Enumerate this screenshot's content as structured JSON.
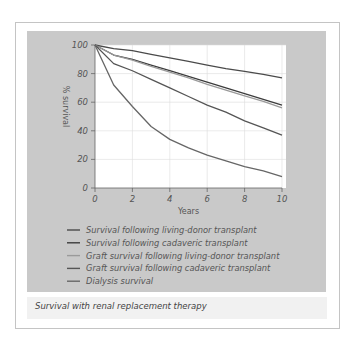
{
  "chart_data": {
    "type": "line",
    "title": "Survival with renal replacement therapy",
    "xlabel": "Years",
    "ylabel": "% survival",
    "x_ticks": [
      "0",
      "2",
      "4",
      "6",
      "8",
      "10"
    ],
    "y_ticks": [
      "0",
      "20",
      "40",
      "60",
      "80",
      "100"
    ],
    "xlim": [
      0,
      10
    ],
    "ylim": [
      0,
      100
    ],
    "grid": true,
    "legend_position": "bottom",
    "x": [
      0,
      1,
      2,
      3,
      4,
      5,
      6,
      7,
      8,
      9,
      10
    ],
    "series": [
      {
        "name": "Survival following living-donor transplant",
        "color": "#4a4a4a",
        "values": [
          100,
          97.5,
          96,
          93.5,
          91,
          88.5,
          86,
          83.5,
          81.5,
          79.5,
          77
        ]
      },
      {
        "name": "Survival following cadaveric transplant",
        "color": "#3c3c3c",
        "values": [
          100,
          93,
          90,
          86,
          82,
          78,
          74,
          70,
          66,
          62,
          58
        ]
      },
      {
        "name": "Graft survival following living-donor transplant",
        "color": "#9a9a9a",
        "values": [
          100,
          93,
          89.5,
          85,
          81,
          77,
          72.5,
          68.5,
          64.5,
          60.5,
          56
        ]
      },
      {
        "name": "Graft survival following cadaveric transplant",
        "color": "#555555",
        "values": [
          100,
          87,
          82,
          76,
          70,
          64,
          58,
          53,
          47,
          42,
          37
        ]
      },
      {
        "name": "Dialysis survival",
        "color": "#666666",
        "values": [
          100,
          72,
          57,
          43,
          34,
          28,
          23,
          19,
          15,
          12,
          8
        ]
      }
    ]
  },
  "legend": [
    "Survival following living-donor transplant",
    "Survival following cadaveric transplant",
    "Graft survival following living-donor transplant",
    "Graft survival following cadaveric transplant",
    "Dialysis survival"
  ],
  "caption": "Survival with renal replacement therapy"
}
